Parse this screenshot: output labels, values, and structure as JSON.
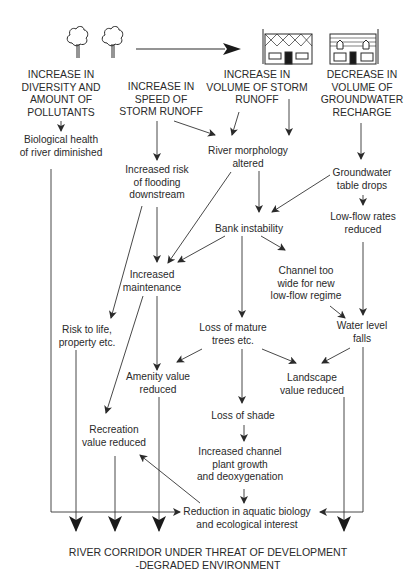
{
  "figure": {
    "icons": {
      "trees": "two-trees-icon",
      "arrow": "long-right-arrow",
      "houses": [
        "house-tiled-roof-icon",
        "house-slatted-roof-icon"
      ]
    },
    "causes": [
      {
        "id": "pollutants",
        "lines": [
          "INCREASE IN",
          "DIVERSITY AND",
          "AMOUNT OF",
          "POLLUTANTS"
        ]
      },
      {
        "id": "speed",
        "lines": [
          "INCREASE IN",
          "SPEED OF",
          "STORM RUNOFF"
        ]
      },
      {
        "id": "volume",
        "lines": [
          "INCREASE IN",
          "VOLUME OF STORM",
          "RUNOFF"
        ]
      },
      {
        "id": "groundwater",
        "lines": [
          "DECREASE IN",
          "VOLUME OF",
          "GROUNDWATER",
          "RECHARGE"
        ]
      }
    ],
    "effects": {
      "bio_health": [
        "Biological health",
        "of river diminished"
      ],
      "flooding": [
        "Increased risk",
        "of flooding",
        "downstream"
      ],
      "morphology": [
        "River morphology",
        "altered"
      ],
      "gw_table": [
        "Groundwater",
        "table drops"
      ],
      "bank": [
        "Bank instability"
      ],
      "lowflow": [
        "Low-flow rates",
        "reduced"
      ],
      "maintenance": [
        "Increased",
        "maintenance"
      ],
      "channel": [
        "Channel too",
        "wide for new",
        "low-flow regime"
      ],
      "risk_life": [
        "Risk to life,",
        "property etc."
      ],
      "trees": [
        "Loss of mature",
        "trees etc."
      ],
      "water_level": [
        "Water level",
        "falls"
      ],
      "amenity": [
        "Amenity value",
        "reduced"
      ],
      "landscape": [
        "Landscape",
        "value reduced"
      ],
      "shade": [
        "Loss of shade"
      ],
      "recreation": [
        "Recreation",
        "value reduced"
      ],
      "plant": [
        "Increased channel",
        "plant growth",
        "and deoxygenation"
      ],
      "aquatic": [
        "Reduction in aquatic biology",
        "and ecological interest"
      ]
    },
    "outcome": [
      "RIVER CORRIDOR UNDER THREAT OF DEVELOPMENT",
      "-DEGRADED ENVIRONMENT"
    ],
    "colors": {
      "ink": "#2a2a2a",
      "background": "#ffffff"
    }
  }
}
